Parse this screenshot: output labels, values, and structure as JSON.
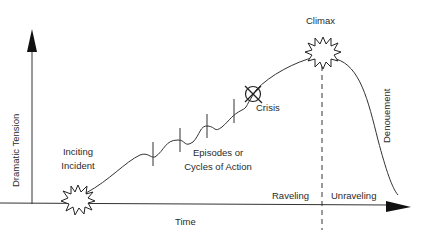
{
  "diagram": {
    "type": "dramatic-arc",
    "axes": {
      "x_label": "Time",
      "y_label": "Dramatic Tension"
    },
    "labels": {
      "inciting_line1": "Inciting",
      "inciting_line2": "Incident",
      "episodes_line1": "Episodes or",
      "episodes_line2": "Cycles of Action",
      "crisis": "Crisis",
      "climax": "Climax",
      "denouement": "Denouement",
      "raveling": "Raveling",
      "unraveling": "Unraveling"
    },
    "colors": {
      "line": "#2a2a2a",
      "background": "#ffffff"
    }
  }
}
